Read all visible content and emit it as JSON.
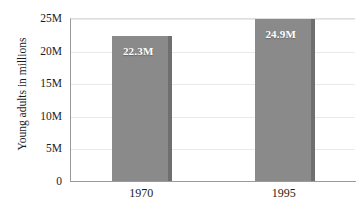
{
  "chart_data": {
    "type": "bar",
    "title": "",
    "xlabel": "",
    "ylabel": "Young adults in millions",
    "categories": [
      "1970",
      "1995"
    ],
    "values": [
      22.3,
      24.9
    ],
    "value_labels": [
      "22.3M",
      "24.9M"
    ],
    "ylim": [
      0,
      25
    ],
    "yticks": [
      0,
      5,
      10,
      15,
      20,
      25
    ],
    "ytick_labels": [
      "0",
      "5M",
      "10M",
      "15M",
      "20M",
      "25M"
    ],
    "grid": true,
    "legend": false,
    "units": "millions",
    "series": [
      {
        "name": "Young adults",
        "values": [
          22.3,
          24.9
        ]
      }
    ]
  },
  "colors": {
    "bar_fill": "#8a8a8a",
    "bar_shadow": "#6f6f6f",
    "gridline": "#e9e9e9",
    "axis_line": "#9a9a9a",
    "text": "#1c1c1c",
    "label_text": "#ffffff",
    "background": "#ffffff"
  }
}
